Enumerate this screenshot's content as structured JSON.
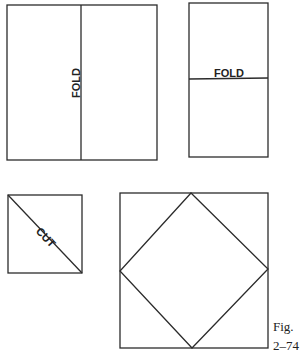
{
  "figure": {
    "panels": [
      {
        "name": "vertical-fold-sheet",
        "label": "FOLD",
        "fold": "vertical"
      },
      {
        "name": "horizontal-fold-sheet",
        "label": "FOLD",
        "fold": "horizontal"
      },
      {
        "name": "diagonal-cut-square",
        "label": "CUT",
        "cut": "diagonal"
      },
      {
        "name": "diamond-in-square",
        "label": ""
      }
    ],
    "caption": {
      "line1": "Fig.",
      "line2": "2–74"
    }
  }
}
